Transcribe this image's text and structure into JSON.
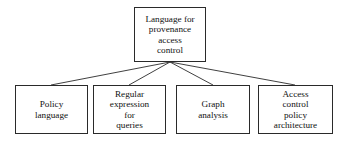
{
  "diagram": {
    "type": "tree",
    "background_color": "#ffffff",
    "line_color": "#2a2a2a",
    "box_border_color": "#2a2a2a",
    "text_color": "#111111",
    "root": {
      "id": "root",
      "label": "Language for\nprovenance\naccess\ncontrol"
    },
    "children": [
      {
        "id": "policy-language",
        "label": "Policy\nlanguage"
      },
      {
        "id": "regular-expression-for-queries",
        "label": "Regular\nexpression\nfor\nqueries"
      },
      {
        "id": "graph-analysis",
        "label": "Graph\nanalysis"
      },
      {
        "id": "access-control-policy-architecture",
        "label": "Access\ncontrol\npolicy\narchitecture"
      }
    ]
  }
}
